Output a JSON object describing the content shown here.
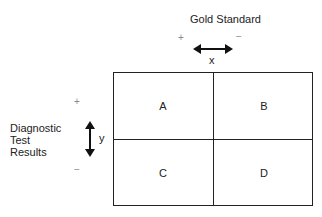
{
  "column_header": {
    "title": "Gold Standard",
    "plus": "+",
    "minus": "−",
    "axis_label": "x"
  },
  "row_header": {
    "lines": [
      "Diagnostic",
      "Test",
      "Results"
    ],
    "plus": "+",
    "minus": "−",
    "axis_label": "y"
  },
  "cells": [
    {
      "id": "A",
      "label": "A"
    },
    {
      "id": "B",
      "label": "B"
    },
    {
      "id": "C",
      "label": "C"
    },
    {
      "id": "D",
      "label": "D"
    }
  ],
  "colors": {
    "line": "#222222",
    "sign": "#888888"
  }
}
